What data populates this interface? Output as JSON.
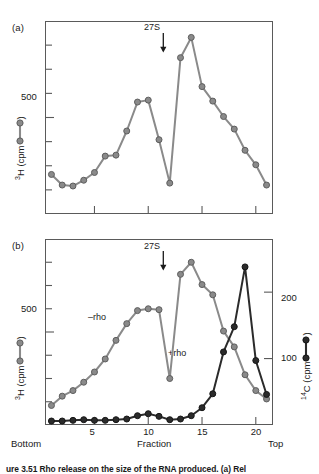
{
  "figure": {
    "caption_partial": "ure  3.51    Rho release on the size of the RNA produced. (a) Rel"
  },
  "panel_a": {
    "tag": "(a)",
    "y_axis": {
      "label_prefix": "3",
      "label_text": "H (cpm",
      "label_suffix": ")",
      "tick_labels": [
        "500"
      ],
      "tick_values": [
        500
      ]
    },
    "marker": {
      "label": "27S",
      "fraction": 11.4
    }
  },
  "panel_b": {
    "tag": "(b)",
    "y_axis_left": {
      "label_prefix": "3",
      "label_text": "H (cpm",
      "label_suffix": ")",
      "tick_labels": [
        "500"
      ],
      "tick_values": [
        500
      ]
    },
    "y_axis_right": {
      "label_prefix": "14",
      "label_text": "C (cpm",
      "label_suffix": ")",
      "tick_labels": [
        "200",
        "100"
      ],
      "tick_values": [
        200,
        100
      ]
    },
    "marker": {
      "label": "27S",
      "fraction": 11.4
    },
    "series_notes": [
      {
        "name": "minus-rho-note",
        "text": "–rho"
      },
      {
        "name": "plus-rho-note",
        "text": "+rho"
      }
    ]
  },
  "x_axis": {
    "tick_labels": [
      "5",
      "10",
      "15",
      "20"
    ],
    "tick_values": [
      5,
      10,
      15,
      20
    ],
    "title": "Fraction",
    "left_cap": "Bottom",
    "right_cap": "Top"
  },
  "colors": {
    "gray_series": "#8a8a8a",
    "gray_series_edge": "#5e5e5e",
    "black_series": "#2b2b2b",
    "axis": "#5a5a5a",
    "text": "#1a1a1a"
  },
  "chart_data": [
    {
      "type": "line",
      "name": "panel-a",
      "title": "(a)",
      "xlabel": "Fraction",
      "ylabel": "3H (cpm)",
      "xlim": [
        0.4,
        21.6
      ],
      "ylim": [
        0,
        1000
      ],
      "ytick_values": [
        125,
        250,
        375,
        500,
        625,
        750,
        875
      ],
      "ylabeled_ticks": [
        500
      ],
      "xtick_values": [
        5,
        10,
        15,
        20
      ],
      "grid": false,
      "legend": "none",
      "annotations": [
        {
          "text": "27S",
          "x": 11.4,
          "y": 930
        }
      ],
      "series": [
        {
          "name": "3H",
          "color": "#8a8a8a",
          "x": [
            1,
            2,
            3,
            4,
            5,
            6,
            7,
            8,
            9,
            10,
            11,
            12,
            13,
            14,
            15,
            16,
            17,
            18,
            19,
            20,
            21
          ],
          "values": [
            205,
            150,
            145,
            175,
            215,
            300,
            305,
            430,
            580,
            590,
            385,
            160,
            810,
            915,
            660,
            585,
            505,
            440,
            330,
            255,
            150,
            125
          ]
        }
      ]
    },
    {
      "type": "line",
      "name": "panel-b",
      "title": "(b)",
      "xlabel": "Fraction",
      "ylabel": "3H (cpm)",
      "y2label": "14C (cpm)",
      "xlim": [
        0.4,
        21.6
      ],
      "ylim": [
        0,
        1000
      ],
      "y2lim": [
        0,
        280
      ],
      "ytick_values": [
        125,
        250,
        375,
        500,
        625,
        750,
        875
      ],
      "ylabeled_ticks": [
        500
      ],
      "y2tick_values": [
        100,
        200
      ],
      "xtick_values": [
        5,
        10,
        15,
        20
      ],
      "grid": false,
      "legend": "inline-labels",
      "annotations": [
        {
          "text": "27S",
          "x": 11.4,
          "y": 950
        }
      ],
      "series": [
        {
          "name": "-rho",
          "axis": "left",
          "color": "#8a8a8a",
          "x": [
            1,
            2,
            3,
            4,
            5,
            6,
            7,
            8,
            9,
            10,
            11,
            12,
            13,
            14,
            15,
            16,
            17,
            18,
            19,
            20,
            21
          ],
          "values": [
            105,
            155,
            185,
            230,
            285,
            355,
            455,
            545,
            615,
            625,
            620,
            250,
            810,
            875,
            755,
            700,
            505,
            420,
            270,
            185,
            140
          ]
        },
        {
          "name": "+rho",
          "axis": "right",
          "color": "#2b2b2b",
          "x": [
            1,
            2,
            3,
            4,
            5,
            6,
            7,
            8,
            9,
            10,
            11,
            12,
            13,
            14,
            15,
            16,
            17,
            18,
            19,
            20,
            21
          ],
          "values": [
            6,
            6,
            7,
            8,
            7,
            7,
            8,
            9,
            14,
            17,
            13,
            8,
            9,
            14,
            26,
            47,
            110,
            148,
            238,
            97,
            46
          ]
        }
      ]
    }
  ]
}
